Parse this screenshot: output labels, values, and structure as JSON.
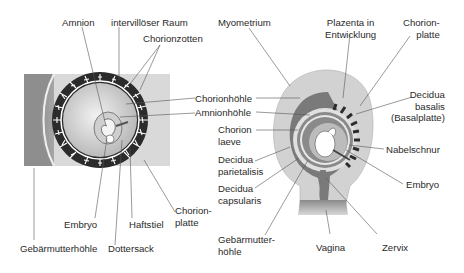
{
  "left_diagram": {
    "labels": {
      "amnion": "Amnion",
      "intervilloeser_raum": "intervillöser Raum",
      "chorionzotten": "Chorionzotten",
      "embryo": "Embryo",
      "haftstiel": "Haftstiel",
      "chorionplatte_l1": "Chorion-",
      "chorionplatte_l2": "platte",
      "gebaermutterhoehle": "Gebärmutterhöhle",
      "dottersack": "Dottersack"
    }
  },
  "shared_labels": {
    "chorionhoehle": "Chorionhöhle",
    "amnionhoehle": "Amnionhöhle"
  },
  "right_diagram": {
    "labels": {
      "myometrium": "Myometrium",
      "plazenta_l1": "Plazenta in",
      "plazenta_l2": "Entwicklung",
      "chorionplatte_l1": "Chorion-",
      "chorionplatte_l2": "platte",
      "decidua_basalis_l1": "Decidua",
      "decidua_basalis_l2": "basalis",
      "decidua_basalis_l3": "(Basalplatte)",
      "chorion_laeve_l1": "Chorion",
      "chorion_laeve_l2": "laeve",
      "decidua_parietalis_l1": "Decidua",
      "decidua_parietalis_l2": "parietalisis",
      "decidua_capsularis_l1": "Decidua",
      "decidua_capsularis_l2": "capsularis",
      "nabelschnur": "Nabelschnur",
      "embryo": "Embryo",
      "gebaermutterhoehle_l1": "Gebärmutter-",
      "gebaermutterhoehle_l2": "höhle",
      "vagina": "Vagina",
      "zervix": "Zervix"
    }
  },
  "colors": {
    "background": "#ffffff",
    "dark_band": "#2b2b2b",
    "myometrium": "#c8c8c8",
    "decidua": "#7a7a7a",
    "light_fill": "#e6e6e6",
    "leader_line": "#555555",
    "text": "#2a2a2a"
  }
}
